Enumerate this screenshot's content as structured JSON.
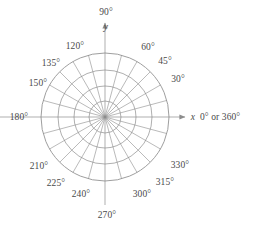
{
  "figure": {
    "type": "polar-coordinate-grid",
    "title": "",
    "geometry": {
      "center_x": 105,
      "center_y": 117,
      "circle_radii": [
        16,
        31,
        47,
        64
      ],
      "circle_count": 4,
      "spoke_step_degrees": 15,
      "axis_color": "#8c8c8c",
      "grid_color": "#8c8c8c",
      "text_color": "#4a4a4a"
    },
    "axes": {
      "x_letter": "x",
      "y_letter": "y",
      "x_arrow": true,
      "y_arrow": true
    },
    "labels": [
      {
        "id": "deg-0",
        "text": "0° or 360°",
        "degrees": 0,
        "x": 200,
        "y": 118,
        "anchor": "left"
      },
      {
        "id": "deg-30",
        "text": "30°",
        "degrees": 30,
        "x": 178,
        "y": 80,
        "anchor": "center"
      },
      {
        "id": "deg-45",
        "text": "45°",
        "degrees": 45,
        "x": 165,
        "y": 62,
        "anchor": "center"
      },
      {
        "id": "deg-60",
        "text": "60°",
        "degrees": 60,
        "x": 148,
        "y": 48,
        "anchor": "center"
      },
      {
        "id": "deg-90",
        "text": "90°",
        "degrees": 90,
        "x": 106,
        "y": 13,
        "anchor": "center"
      },
      {
        "id": "deg-120",
        "text": "120°",
        "degrees": 120,
        "x": 75,
        "y": 47,
        "anchor": "center"
      },
      {
        "id": "deg-135",
        "text": "135°",
        "degrees": 135,
        "x": 51,
        "y": 64,
        "anchor": "center"
      },
      {
        "id": "deg-150",
        "text": "150°",
        "degrees": 150,
        "x": 38,
        "y": 84,
        "anchor": "center"
      },
      {
        "id": "deg-180",
        "text": "180°",
        "degrees": 180,
        "x": 19,
        "y": 118,
        "anchor": "center"
      },
      {
        "id": "deg-210",
        "text": "210°",
        "degrees": 210,
        "x": 39,
        "y": 167,
        "anchor": "center"
      },
      {
        "id": "deg-225",
        "text": "225°",
        "degrees": 225,
        "x": 56,
        "y": 184,
        "anchor": "center"
      },
      {
        "id": "deg-240",
        "text": "240°",
        "degrees": 240,
        "x": 81,
        "y": 195,
        "anchor": "center"
      },
      {
        "id": "deg-270",
        "text": "270°",
        "degrees": 270,
        "x": 107,
        "y": 216,
        "anchor": "center"
      },
      {
        "id": "deg-300",
        "text": "300°",
        "degrees": 300,
        "x": 142,
        "y": 195,
        "anchor": "center"
      },
      {
        "id": "deg-315",
        "text": "315°",
        "degrees": 315,
        "x": 165,
        "y": 183,
        "anchor": "center"
      },
      {
        "id": "deg-330",
        "text": "330°",
        "degrees": 330,
        "x": 180,
        "y": 166,
        "anchor": "center"
      }
    ],
    "axis_letters": [
      {
        "id": "y-letter",
        "text": "y",
        "x": 106,
        "y": 28,
        "anchor": "center"
      },
      {
        "id": "x-letter",
        "text": "x",
        "x": 193,
        "y": 118,
        "anchor": "center"
      }
    ]
  }
}
